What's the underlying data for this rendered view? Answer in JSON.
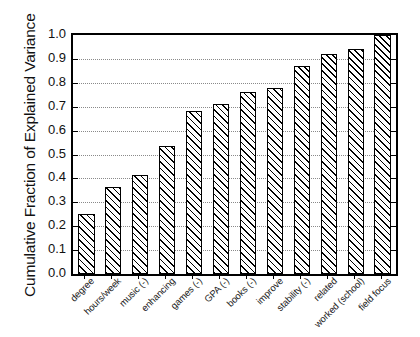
{
  "chart_data": {
    "type": "bar",
    "title": "",
    "subtitle": "",
    "xlabel": "",
    "ylabel": "Cumulative Fraction of Explained Variance",
    "categories": [
      "degree",
      "hours/week",
      "music (-)",
      "enhancing",
      "games (-)",
      "GPA (-)",
      "books (-)",
      "improve",
      "stability (-)",
      "related",
      "worked (school)",
      "field focus"
    ],
    "values": [
      0.25,
      0.365,
      0.415,
      0.535,
      0.68,
      0.71,
      0.76,
      0.78,
      0.87,
      0.92,
      0.94,
      1.0
    ],
    "ylim": [
      0.0,
      1.0
    ],
    "yticks": [
      0.0,
      0.1,
      0.2,
      0.3,
      0.4,
      0.5,
      0.6,
      0.7,
      0.8,
      0.9,
      1.0
    ],
    "ytick_labels": [
      "0.0",
      "0.1",
      "0.2",
      "0.3",
      "0.4",
      "0.5",
      "0.6",
      "0.7",
      "0.8",
      "0.9",
      "1.0"
    ],
    "grid": "horizontal-dotted",
    "legend": "none",
    "bar_fill": "diagonal-hatch",
    "bar_edge_color": "#000000",
    "bar_face_color": "#ffffff",
    "grid_color": "#8a8a8a",
    "axis_color": "#000000",
    "background_color": "#ffffff"
  }
}
